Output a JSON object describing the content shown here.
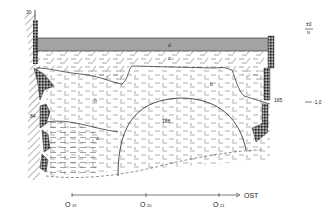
{
  "drawing": {
    "type": "archaeological-section-profile",
    "labels": {
      "top_left_number": "30",
      "left_wall_number": "84",
      "right_wall_number": "165",
      "feature_number": "188",
      "layer_d": "d",
      "layer_c": "c",
      "layer_b_left": "b",
      "layer_b_right": "b",
      "layer_a": "a"
    },
    "elevation": {
      "zero_label": "±0",
      "zero_sub": "N",
      "minus_label": "-1,0"
    },
    "axis": {
      "direction_label": "OST",
      "markers": [
        {
          "prefix": "O",
          "num": "19"
        },
        {
          "prefix": "O",
          "num": "20"
        },
        {
          "prefix": "O",
          "num": "21"
        }
      ]
    },
    "colors": {
      "ink": "#222222",
      "hatch": "#555555",
      "background": "#ffffff"
    }
  }
}
